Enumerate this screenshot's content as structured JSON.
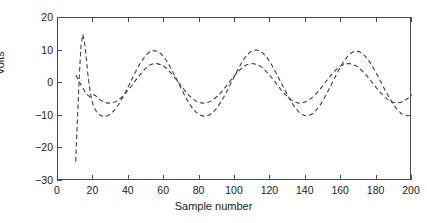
{
  "chart_data": {
    "type": "line",
    "title": "",
    "xlabel": "Sample number",
    "ylabel": "Volts",
    "xlim": [
      0,
      200
    ],
    "ylim": [
      -30,
      20
    ],
    "xticks": [
      0,
      20,
      40,
      60,
      80,
      100,
      120,
      140,
      160,
      180,
      200
    ],
    "yticks": [
      20,
      10,
      0,
      -10,
      -20,
      -30
    ],
    "xticklabels": [
      "0",
      "20",
      "40",
      "60",
      "80",
      "100",
      "120",
      "140",
      "160",
      "180",
      "200"
    ],
    "yticklabels": [
      "20",
      "10",
      "0",
      "−10",
      "−20",
      "−30"
    ],
    "grid": false,
    "legend": null,
    "box": true,
    "line_color": "#3c3c3c",
    "line_style": "dashed",
    "series": [
      {
        "name": "filter output (large amplitude)",
        "style": "dashed",
        "color": "#3c3c3c",
        "x": [
          10,
          11,
          12,
          13,
          14,
          15,
          16,
          17,
          18,
          19,
          20,
          22,
          24,
          26,
          28,
          30,
          32,
          34,
          36,
          38,
          40,
          42,
          44,
          46,
          48,
          50,
          52,
          54,
          56,
          58,
          60,
          62,
          64,
          66,
          68,
          70,
          72,
          74,
          76,
          78,
          80,
          82,
          84,
          86,
          88,
          90,
          92,
          94,
          96,
          98,
          100,
          102,
          104,
          106,
          108,
          110,
          112,
          114,
          116,
          118,
          120,
          122,
          124,
          126,
          128,
          130,
          132,
          134,
          136,
          138,
          140,
          142,
          144,
          146,
          148,
          150,
          152,
          154,
          156,
          158,
          160,
          162,
          164,
          166,
          168,
          170,
          172,
          174,
          176,
          178,
          180,
          182,
          184,
          186,
          188,
          190,
          192,
          194,
          196,
          198,
          200
        ],
        "y": [
          -24.0,
          -11.0,
          2.0,
          11.5,
          15.0,
          12.5,
          7.5,
          2.0,
          -2.0,
          -5.0,
          -7.0,
          -9.0,
          -9.9,
          -10.2,
          -10.0,
          -9.3,
          -8.2,
          -6.7,
          -4.9,
          -2.9,
          -0.7,
          1.5,
          3.7,
          5.7,
          7.4,
          8.8,
          9.7,
          10.0,
          9.8,
          9.1,
          7.9,
          6.3,
          4.4,
          2.3,
          0.1,
          -2.1,
          -4.2,
          -6.1,
          -7.7,
          -8.9,
          -9.7,
          -10.1,
          -10.1,
          -9.6,
          -8.7,
          -7.4,
          -5.8,
          -3.9,
          -1.9,
          0.3,
          2.5,
          4.6,
          6.5,
          8.1,
          9.3,
          10.0,
          10.2,
          9.9,
          9.1,
          7.9,
          6.3,
          4.4,
          2.4,
          0.2,
          -1.9,
          -4.0,
          -5.9,
          -7.5,
          -8.8,
          -9.6,
          -10.0,
          -9.9,
          -9.3,
          -8.2,
          -6.8,
          -5.0,
          -3.0,
          -0.9,
          1.3,
          3.4,
          5.4,
          7.1,
          8.5,
          9.4,
          9.8,
          9.7,
          9.1,
          8.0,
          6.6,
          4.8,
          2.9,
          0.8,
          -1.3,
          -3.3,
          -5.2,
          -6.9,
          -8.3,
          -9.3,
          -9.9,
          -10.0,
          -9.6
        ]
      },
      {
        "name": "reference signal (small amplitude)",
        "style": "dashed",
        "color": "#3c3c3c",
        "x": [
          10,
          12,
          14,
          16,
          18,
          19,
          20,
          21,
          22,
          24,
          26,
          28,
          30,
          32,
          34,
          36,
          38,
          40,
          42,
          44,
          46,
          48,
          50,
          52,
          54,
          56,
          58,
          60,
          62,
          64,
          66,
          68,
          70,
          72,
          74,
          76,
          78,
          80,
          82,
          84,
          86,
          88,
          90,
          92,
          94,
          96,
          98,
          100,
          102,
          104,
          106,
          108,
          110,
          112,
          114,
          116,
          118,
          120,
          122,
          124,
          126,
          128,
          130,
          132,
          134,
          136,
          138,
          140,
          142,
          144,
          146,
          148,
          150,
          152,
          154,
          156,
          158,
          160,
          162,
          164,
          166,
          168,
          170,
          172,
          174,
          176,
          178,
          180,
          182,
          184,
          186,
          188,
          190,
          192,
          194,
          196,
          198,
          200
        ],
        "y": [
          2.5,
          0.5,
          -1.5,
          -3.2,
          -4.2,
          -4.0,
          -3.6,
          -3.7,
          -4.2,
          -5.2,
          -5.8,
          -6.1,
          -6.1,
          -5.8,
          -5.2,
          -4.3,
          -3.2,
          -1.9,
          -0.5,
          1.0,
          2.4,
          3.7,
          4.8,
          5.6,
          6.0,
          6.0,
          5.7,
          5.1,
          4.2,
          3.0,
          1.7,
          0.3,
          -1.1,
          -2.5,
          -3.7,
          -4.8,
          -5.5,
          -6.0,
          -6.1,
          -6.0,
          -5.6,
          -4.9,
          -4.0,
          -2.9,
          -1.6,
          -0.2,
          1.2,
          2.5,
          3.7,
          4.7,
          5.5,
          5.9,
          6.0,
          5.8,
          5.3,
          4.5,
          3.4,
          2.2,
          0.8,
          -0.6,
          -2.0,
          -3.2,
          -4.3,
          -5.2,
          -5.8,
          -6.1,
          -6.0,
          -5.7,
          -5.1,
          -4.2,
          -3.1,
          -1.9,
          -0.5,
          0.9,
          2.3,
          3.5,
          4.6,
          5.4,
          5.9,
          6.0,
          5.9,
          5.4,
          4.7,
          3.7,
          2.6,
          1.3,
          -0.1,
          -1.5,
          -2.8,
          -3.9,
          -4.9,
          -5.6,
          -6.0,
          -6.0,
          -5.8,
          -5.3,
          -4.5,
          -3.5
        ]
      }
    ]
  }
}
